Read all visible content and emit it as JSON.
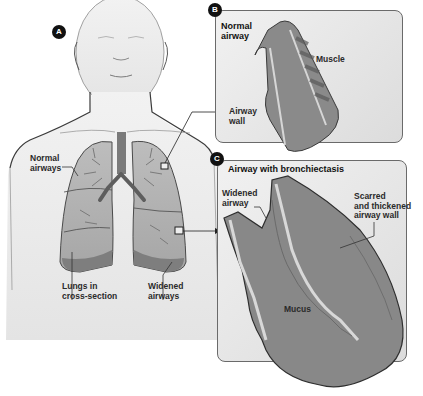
{
  "figure": {
    "panels": [
      {
        "id": "A",
        "badge": "A",
        "description": "Human torso with lungs in cross-section"
      },
      {
        "id": "B",
        "badge": "B",
        "title": "Normal airway"
      },
      {
        "id": "C",
        "badge": "C",
        "title": "Airway with bronchiectasis"
      }
    ]
  },
  "labels": {
    "panel_a": {
      "normal_airways": "Normal\nairways",
      "lungs_cross_section": "Lungs in\ncross-section",
      "widened_airways": "Widened\nairways"
    },
    "panel_b": {
      "title": "Normal\nairway",
      "muscle": "Muscle",
      "airway_wall": "Airway\nwall"
    },
    "panel_c": {
      "title": "Airway with bronchiectasis",
      "widened_airway": "Widened\nairway",
      "scarred_wall": "Scarred\nand thickened\nairway wall",
      "mucus": "Mucus"
    }
  },
  "colors": {
    "background": "#ffffff",
    "badge": "#111111",
    "panel_border": "#6a6a6a",
    "tissue_dark": "#6e6e6e",
    "tissue_mid": "#9a9a9a",
    "tissue_light": "#c8c8c8",
    "skin": "#e8e8e8",
    "outline": "#3a3a3a"
  }
}
